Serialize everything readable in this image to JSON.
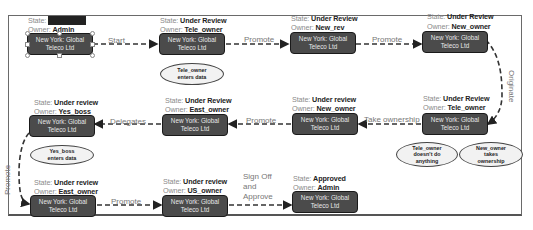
{
  "diagram": {
    "nodes": [
      {
        "id": "n1",
        "state_label": "State:",
        "state": "Not Started",
        "owner_label": "Owner:",
        "owner": "Admin",
        "text1": "New York: Global",
        "text2": "Teleco Ltd"
      },
      {
        "id": "n2",
        "state_label": "State:",
        "state": "Under Review",
        "owner_label": "Owner:",
        "owner": "Tele_owner",
        "text1": "New York: Global",
        "text2": "Teleco Ltd"
      },
      {
        "id": "n3",
        "state_label": "State:",
        "state": "Under Review",
        "owner_label": "Owner:",
        "owner": "New_rev",
        "text1": "New York: Global",
        "text2": "Teleco Ltd"
      },
      {
        "id": "n4",
        "state_label": "State:",
        "state": "Under Review",
        "owner_label": "Owner:",
        "owner": "New_owner",
        "text1": "New York: Global",
        "text2": "Teleco Ltd"
      },
      {
        "id": "n5",
        "state_label": "State:",
        "state": "Under Review",
        "owner_label": "Owner:",
        "owner": "Tele_owner",
        "text1": "New York: Global",
        "text2": "Teleco Ltd"
      },
      {
        "id": "n6",
        "state_label": "State:",
        "state": "Under review",
        "owner_label": "Owner:",
        "owner": "New_owner",
        "text1": "New York: Global",
        "text2": "Teleco Ltd"
      },
      {
        "id": "n7",
        "state_label": "State:",
        "state": "Under Review",
        "owner_label": "Owner:",
        "owner": "East_owner",
        "text1": "New York: Global",
        "text2": "Teleco Ltd"
      },
      {
        "id": "n8",
        "state_label": "State:",
        "state": "Under review",
        "owner_label": "Owner:",
        "owner": "Yes_boss",
        "text1": "New York: Global",
        "text2": "Teleco Ltd"
      },
      {
        "id": "n9",
        "state_label": "State:",
        "state": "Under review",
        "owner_label": "Owner:",
        "owner": "East_owner",
        "text1": "New York: Global",
        "text2": "Teleco Ltd"
      },
      {
        "id": "n10",
        "state_label": "State:",
        "state": "Under review",
        "owner_label": "Owner:",
        "owner": "US_owner",
        "text1": "New York: Global",
        "text2": "Teleco Ltd"
      },
      {
        "id": "n11",
        "state_label": "State:",
        "state": "Approved",
        "owner_label": "Owner:",
        "owner": "Admin",
        "text1": "New York: Global",
        "text2": "Teleco Ltd"
      }
    ],
    "edges": {
      "start": "Start",
      "promote1": "Promote",
      "promote2": "Promote",
      "originate": "Originate",
      "take_ownership": "Take ownership",
      "promote3": "Promote",
      "delegates": "Delegates",
      "promote4": "Promote",
      "promote5": "Promote",
      "signoff1": "Sign Off",
      "signoff2": "and",
      "signoff3": "Approve"
    },
    "notes": {
      "tele_enters": [
        "Tele_owner",
        "enters data"
      ],
      "yes_enters": [
        "Yes_boss",
        "enters data"
      ],
      "tele_nothing": [
        "Tele_owner",
        "doesn't do",
        "anything"
      ],
      "new_takes": [
        "New_owner",
        "takes",
        "ownership"
      ]
    }
  }
}
